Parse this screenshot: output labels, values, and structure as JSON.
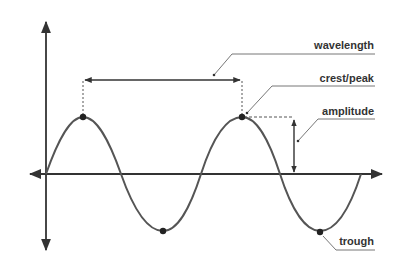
{
  "diagram": {
    "colors": {
      "background": "#ffffff",
      "axis": "#333333",
      "wave": "#555555",
      "points": "#222222",
      "text": "#333333",
      "leader": "#555555"
    },
    "labels": {
      "wavelength": "wavelength",
      "crest": "crest/peak",
      "amplitude": "amplitude",
      "trough": "trough"
    },
    "axes": {
      "x_axis": "horizontal axis with arrows at both ends",
      "y_axis": "vertical axis with arrows at both ends"
    },
    "wave": {
      "type": "sine",
      "cycles": 2,
      "points": [
        "crest 1",
        "trough 1",
        "crest 2",
        "trough 2"
      ]
    }
  }
}
